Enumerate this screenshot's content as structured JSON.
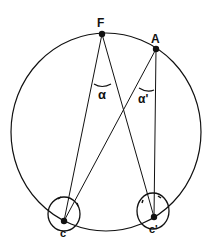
{
  "diagram": {
    "type": "geometry",
    "points": {
      "F": {
        "label": "F",
        "x": 102,
        "y": 34
      },
      "A": {
        "label": "A",
        "x": 156,
        "y": 49
      },
      "C": {
        "label": "c",
        "x": 64,
        "y": 221
      },
      "Cp": {
        "label": "c'",
        "x": 154,
        "y": 217
      }
    },
    "angles": {
      "alpha": {
        "label": "α",
        "vertex": "F"
      },
      "alpha_prime": {
        "label": "α'",
        "vertex": "A"
      }
    },
    "colors": {
      "stroke": "#111111",
      "background": "#ffffff"
    }
  }
}
